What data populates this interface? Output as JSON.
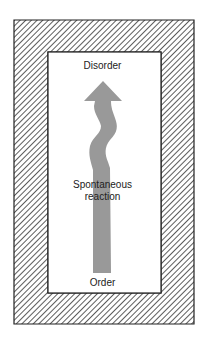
{
  "diagram": {
    "type": "entropy-diagram",
    "labels": {
      "top": "Disorder",
      "middle_line1": "Spontaneous",
      "middle_line2": "reaction",
      "bottom": "Order"
    },
    "colors": {
      "arrow": "#999999",
      "hatch": "#333333",
      "border": "#222222",
      "background": "#ffffff"
    },
    "arrow_direction": "up",
    "arrow_from": "Order",
    "arrow_to": "Disorder"
  }
}
